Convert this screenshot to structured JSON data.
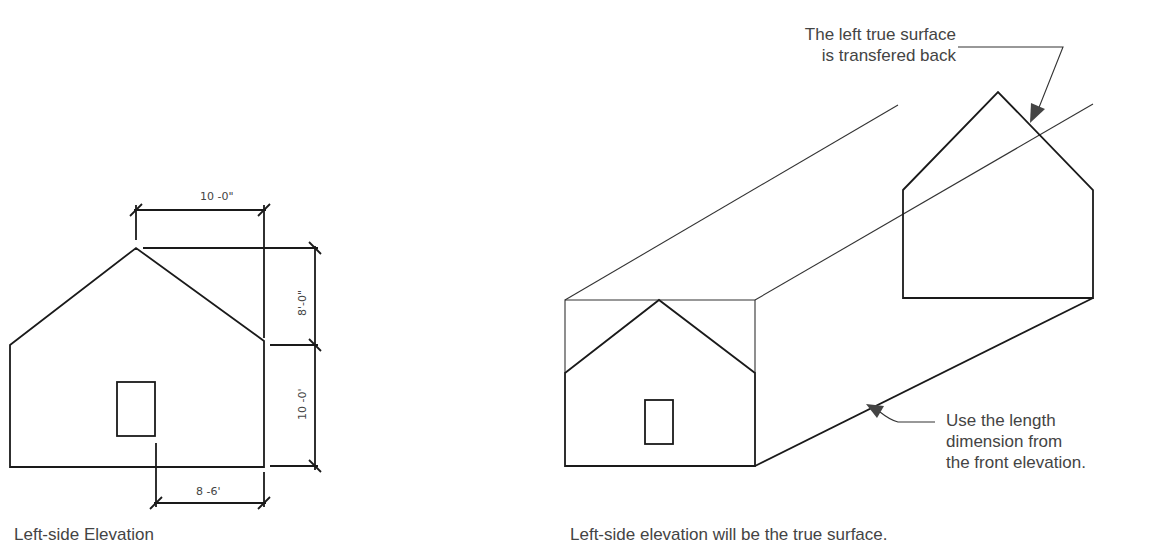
{
  "top_caption_fragment": "",
  "left_figure": {
    "caption": "Left-side Elevation",
    "dimensions": {
      "top_width": "10 -0\"",
      "roof_height": "8'-0\"",
      "wall_height": "10 -0'",
      "bottom_offset": "8 -6'"
    }
  },
  "right_figure": {
    "caption": "Left-side elevation will be the true surface.",
    "callout_top": {
      "line1": "The left true surface",
      "line2": "is transfered back"
    },
    "callout_bottom": {
      "line1": "Use the length",
      "line2": "dimension from",
      "line3": "the front elevation."
    }
  }
}
